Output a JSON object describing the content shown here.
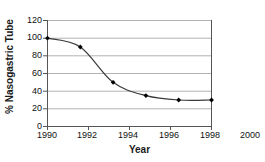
{
  "chart_data": {
    "type": "line",
    "title": "",
    "xlabel": "Year",
    "ylabel": "% Nasogastric Tube",
    "x": [
      1990,
      1992,
      1994,
      1996,
      1998,
      2000
    ],
    "values": [
      100,
      90,
      50,
      35,
      30,
      30
    ],
    "series": [
      {
        "name": "% Nasogastric Tube",
        "values": [
          100,
          90,
          50,
          35,
          30,
          30
        ]
      }
    ],
    "xticks": [
      "1990",
      "1992",
      "1994",
      "1996",
      "1998",
      "2000"
    ],
    "yticks": [
      "0",
      "20",
      "40",
      "60",
      "80",
      "100",
      "120"
    ],
    "xlim": [
      1990,
      2000
    ],
    "ylim": [
      0,
      120
    ],
    "grid": "horizontal",
    "legend": "none",
    "marker": "filled-diamond",
    "line_style": "smooth-solid",
    "colors": {
      "line": "#3a3a3a",
      "marker": "#000000",
      "grid": "#b3b3b3",
      "axis": "#555555",
      "text": "#111111",
      "background": "#ffffff"
    }
  }
}
